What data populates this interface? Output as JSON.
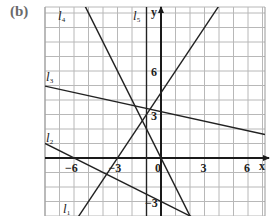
{
  "panel_label": "(b)",
  "chart_data": {
    "type": "line",
    "title": "",
    "xlabel": "x",
    "ylabel": "y",
    "xlim": [
      -8,
      7
    ],
    "ylim": [
      -4,
      10.4
    ],
    "grid": true,
    "x_ticks": [
      -6,
      -3,
      0,
      3,
      6
    ],
    "y_ticks": [
      6,
      3,
      -3
    ],
    "tick_labels": {
      "x": [
        "−6",
        "−3",
        "0",
        "3",
        "6"
      ],
      "y": [
        "6",
        "3",
        "−3"
      ]
    },
    "series": [
      {
        "name": "l1",
        "label": "l",
        "subscript": "1",
        "equation": "y = 1.5x + 4.5",
        "slope": 1.5,
        "intercept": 4.5
      },
      {
        "name": "l2",
        "label": "l",
        "subscript": "2",
        "equation": "y = -0.5x - 3",
        "slope": -0.5,
        "intercept": -3
      },
      {
        "name": "l3",
        "label": "l",
        "subscript": "3",
        "equation": "y = -0.22x + 3.2",
        "slope": -0.22,
        "intercept": 3.2
      },
      {
        "name": "l4",
        "label": "l",
        "subscript": "4",
        "equation": "y = -2x",
        "slope": -2,
        "intercept": 0
      },
      {
        "name": "l5",
        "label": "l",
        "subscript": "5",
        "equation": "x = -1",
        "vertical_x": -1
      }
    ]
  }
}
